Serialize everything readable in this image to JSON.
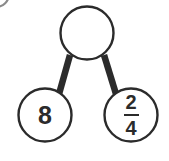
{
  "diagram": {
    "type": "number-bond",
    "stroke_color": "#2b2b2b",
    "fill_color": "#ffffff",
    "background_color": "#ffffff",
    "nodes": {
      "parent": {
        "label": "",
        "cx": 87,
        "cy": 33,
        "r": 27
      },
      "left_child": {
        "label": "8",
        "cx": 45,
        "cy": 115,
        "r": 27
      },
      "right_child": {
        "label": "2/4",
        "numerator": "2",
        "denominator": "4",
        "cx": 131,
        "cy": 115,
        "r": 27
      }
    },
    "connectors": [
      {
        "name": "parent-to-left",
        "x1": 70,
        "y1": 55,
        "x2": 59,
        "y2": 94
      },
      {
        "name": "parent-to-right",
        "x1": 104,
        "y1": 55,
        "x2": 116,
        "y2": 94
      }
    ],
    "corner_arc": {
      "name": "cropped-circle-arc",
      "cx": -4,
      "cy": -6,
      "r": 13
    }
  }
}
